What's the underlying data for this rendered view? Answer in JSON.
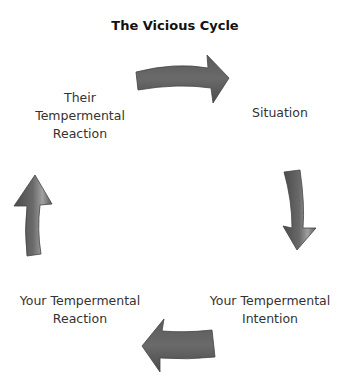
{
  "diagram": {
    "title": "The Vicious Cycle",
    "type": "cycle",
    "nodes": [
      {
        "id": "situation",
        "label": "Situation"
      },
      {
        "id": "your_intention",
        "label": "Your Tempermental Intention"
      },
      {
        "id": "your_reaction",
        "label": "Your Tempermental Reaction"
      },
      {
        "id": "their_reaction",
        "label": "Their Tempermental Reaction"
      }
    ],
    "labels": {
      "situation": "Situation",
      "your_intention_l1": "Your Tempermental",
      "your_intention_l2": "Intention",
      "your_reaction_l1": "Your Tempermental",
      "your_reaction_l2": "Reaction",
      "their_reaction_l1": "Their",
      "their_reaction_l2": "Tempermental",
      "their_reaction_l3": "Reaction"
    },
    "edges": [
      {
        "from": "their_reaction",
        "to": "situation",
        "direction": "right"
      },
      {
        "from": "situation",
        "to": "your_intention",
        "direction": "down"
      },
      {
        "from": "your_intention",
        "to": "your_reaction",
        "direction": "left"
      },
      {
        "from": "your_reaction",
        "to": "their_reaction",
        "direction": "up"
      }
    ],
    "colors": {
      "arrow_fill": "#5a5a5a",
      "arrow_highlight": "#9a9a9a",
      "text": "#333333"
    }
  }
}
